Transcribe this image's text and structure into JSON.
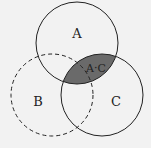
{
  "diagram": {
    "type": "venn",
    "background": "#f2f2f2",
    "stroke": "#222222",
    "shade_color": "#6a6a6a",
    "sets": [
      {
        "id": "A",
        "label": "A",
        "style": "solid"
      },
      {
        "id": "B",
        "label": "B",
        "style": "dashed"
      },
      {
        "id": "C",
        "label": "C",
        "style": "solid"
      }
    ],
    "shaded_region": {
      "label": "A·C",
      "description": "intersection of A and C"
    }
  }
}
